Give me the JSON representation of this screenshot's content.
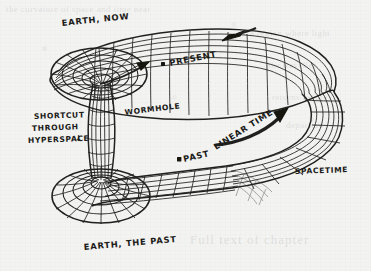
{
  "figure": {
    "kind": "hand-drawn-diagram",
    "background_color": "#f3f3f1",
    "ink_color": "#20201e"
  },
  "labels": {
    "earth_now": "EARTH, NOW",
    "earth_the_past": "EARTH, THE PAST",
    "present": "PRESENT",
    "past": "PAST",
    "wormhole": "WORMHOLE",
    "spacetime": "SPACETIME",
    "linear_time": "LINEAR TIME",
    "shortcut_line1": "SHORTCUT",
    "shortcut_line2": "THROUGH",
    "shortcut_line3": "HYPERSPACE",
    "down_arrow_glyph": "↓"
  },
  "markers": {
    "present_point": "present-event-dot",
    "past_point": "past-event-dot"
  },
  "arrows": {
    "into_funnel": "arrow-into-wormhole-mouth",
    "present_direction": "arrow-pointing-left-on-upper-sheet",
    "linear_time_direction": "curved-arrow-along-linear-time"
  },
  "ghost_text": {
    "rows": [
      "the curvature of space and time near",
      "a region where light",
      "the traveller",
      "returns before",
      "departure",
      "Full text of chapter"
    ]
  }
}
